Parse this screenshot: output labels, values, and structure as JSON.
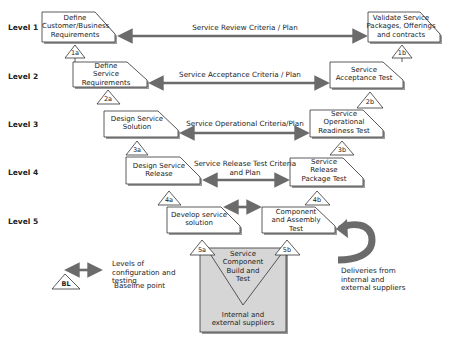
{
  "levels": [
    "Level 1",
    "Level 2",
    "Level 3",
    "Level 4",
    "Level 5"
  ],
  "left_boxes": [
    {
      "id": "define-customer-requirements",
      "text": "Define Customer/Business Requirements",
      "lines": [
        "Define",
        "Customer/Business",
        "Requirements"
      ]
    },
    {
      "id": "define-service-requirements",
      "text": "Define Service Requirements",
      "lines": [
        "Define",
        "Service",
        "Requirements"
      ]
    },
    {
      "id": "design-service-solution",
      "text": "Design Service Solution",
      "lines": [
        "Design Service",
        "Solution"
      ]
    },
    {
      "id": "design-service-release",
      "text": "Design Service Release",
      "lines": [
        "Design Service",
        "Release"
      ]
    },
    {
      "id": "develop-service-solution",
      "text": "Develop service solution",
      "lines": [
        "Develop service",
        "solution"
      ]
    }
  ],
  "right_boxes": [
    {
      "id": "validate-service-packages",
      "text": "Validate Service Packages, Offerings and contracts",
      "lines": [
        "Validate Service",
        "Packages, Offerings",
        "and contracts"
      ]
    },
    {
      "id": "service-acceptance-test",
      "text": "Service Acceptance Test",
      "lines": [
        "Service",
        "Acceptance Test"
      ]
    },
    {
      "id": "service-operational-readiness-test",
      "text": "Service Operational Readiness Test",
      "lines": [
        "Service",
        "Operational",
        "Readiness Test"
      ]
    },
    {
      "id": "service-release-package-test",
      "text": "Service Release Package Test",
      "lines": [
        "Service",
        "Release",
        "Package Test"
      ]
    },
    {
      "id": "component-assembly-test",
      "text": "Component and Assembly Test",
      "lines": [
        "Component",
        "and Assembly",
        "Test"
      ]
    }
  ],
  "arrows": [
    {
      "level": 1,
      "label": "Service Review Criteria / Plan"
    },
    {
      "level": 2,
      "label": "Service Acceptance Criteria / Plan"
    },
    {
      "level": 3,
      "label": "Service Operational Criteria/Plan"
    },
    {
      "level": 4,
      "label": "Service Release Test Criteria and Plan",
      "lines": [
        "Service Release Test Criteria",
        "and Plan"
      ]
    },
    {
      "level": 5,
      "label": ""
    }
  ],
  "baseline_points": [
    "1a",
    "1b",
    "2a",
    "2b",
    "3a",
    "3b",
    "4a",
    "4b",
    "5a",
    "5b"
  ],
  "component_build": {
    "v_text": [
      "Service",
      "Component",
      "Build and",
      "Test"
    ],
    "box_text": [
      "Internal and",
      "external suppliers"
    ]
  },
  "deliveries": {
    "lines": [
      "Deliveries from",
      "internal and",
      "external suppliers"
    ]
  },
  "legend": {
    "arrow_label": [
      "Levels of",
      "configuration and",
      "testing"
    ],
    "baseline_symbol": "BL",
    "baseline_label": "Baseline point"
  },
  "colors": {
    "arrow": "#6b6b6b",
    "box_border": "#333333",
    "box_shadow": "#9a9a9a",
    "supplier_fill": "#d6d6d6"
  }
}
